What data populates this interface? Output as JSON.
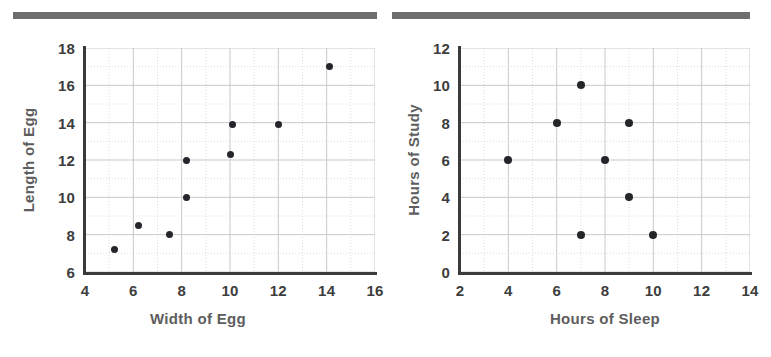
{
  "page": {
    "background": "#ffffff",
    "rule_color": "#6e6e6e",
    "axis_color": "#3a3a3a",
    "grid_color": "#c9c9c9",
    "grid_minor_color": "#dcdcdc",
    "point_color": "#25262b",
    "tick_color": "#3d3d3d",
    "title_color": "#5d5d5d"
  },
  "charts": [
    {
      "id": "egg-scatter",
      "name": "width-vs-length-of-egg-scatter"
    },
    {
      "id": "sleep-study-scatter",
      "name": "sleep-vs-study-scatter"
    }
  ],
  "chart_data": [
    {
      "type": "scatter",
      "title": "",
      "xlabel": "Width of Egg",
      "ylabel": "Length of Egg",
      "xlim": [
        4,
        16
      ],
      "ylim": [
        6,
        18
      ],
      "xticks": [
        4,
        6,
        8,
        10,
        12,
        14,
        16
      ],
      "yticks": [
        6,
        8,
        10,
        12,
        14,
        16,
        18
      ],
      "xtick_labels": [
        "4",
        "6",
        "8",
        "10",
        "12",
        "14",
        "16"
      ],
      "ytick_labels": [
        "6",
        "8",
        "10",
        "12",
        "14",
        "16",
        "18"
      ],
      "grid": true,
      "grid_major_step_x": 2,
      "grid_major_step_y": 2,
      "grid_minor_step_x": 1,
      "grid_minor_step_y": 1,
      "legend": null,
      "points": [
        {
          "x": 5.2,
          "y": 7.2
        },
        {
          "x": 6.2,
          "y": 8.5
        },
        {
          "x": 7.5,
          "y": 8.0
        },
        {
          "x": 8.2,
          "y": 10.0
        },
        {
          "x": 8.2,
          "y": 12.0
        },
        {
          "x": 10.0,
          "y": 12.3
        },
        {
          "x": 10.1,
          "y": 13.9
        },
        {
          "x": 12.0,
          "y": 13.9
        },
        {
          "x": 14.1,
          "y": 17.0
        }
      ]
    },
    {
      "type": "scatter",
      "title": "",
      "xlabel": "Hours of Sleep",
      "ylabel": "Hours of Study",
      "xlim": [
        2,
        14
      ],
      "ylim": [
        0,
        12
      ],
      "xticks": [
        2,
        4,
        6,
        8,
        10,
        12,
        14
      ],
      "yticks": [
        0,
        2,
        4,
        6,
        8,
        10,
        12
      ],
      "xtick_labels": [
        "2",
        "4",
        "6",
        "8",
        "10",
        "12",
        "14"
      ],
      "ytick_labels": [
        "0",
        "2",
        "4",
        "6",
        "8",
        "10",
        "12"
      ],
      "grid": true,
      "grid_major_step_x": 2,
      "grid_major_step_y": 2,
      "grid_minor_step_x": 1,
      "grid_minor_step_y": 1,
      "legend": null,
      "points": [
        {
          "x": 4,
          "y": 6
        },
        {
          "x": 6,
          "y": 8
        },
        {
          "x": 7,
          "y": 10
        },
        {
          "x": 7,
          "y": 2
        },
        {
          "x": 8,
          "y": 6
        },
        {
          "x": 9,
          "y": 8
        },
        {
          "x": 9,
          "y": 4
        },
        {
          "x": 10,
          "y": 2
        }
      ]
    }
  ]
}
